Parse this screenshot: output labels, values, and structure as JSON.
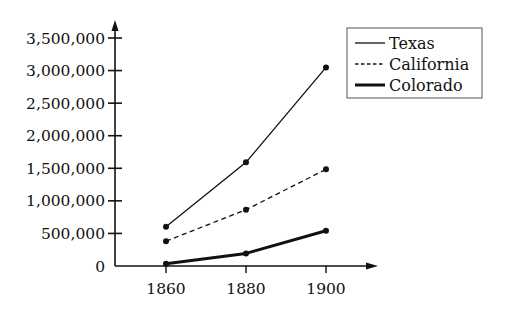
{
  "chart_data": {
    "type": "line",
    "title": "",
    "xlabel": "",
    "ylabel": "",
    "x": [
      1860,
      1880,
      1900
    ],
    "x_tick_labels": [
      "1860",
      "1880",
      "1900"
    ],
    "y_ticks": [
      0,
      500000,
      1000000,
      1500000,
      2000000,
      2500000,
      3000000,
      3500000
    ],
    "y_tick_labels": [
      "0",
      "500,000",
      "1,000,000",
      "1,500,000",
      "2,000,000",
      "2,500,000",
      "3,000,000",
      "3,500,000"
    ],
    "ylim": [
      0,
      3500000
    ],
    "grid": false,
    "legend_position": "upper right",
    "series": [
      {
        "name": "Texas",
        "style": "solid",
        "values": [
          604000,
          1592000,
          3049000
        ]
      },
      {
        "name": "California",
        "style": "dashed",
        "values": [
          380000,
          865000,
          1485000
        ]
      },
      {
        "name": "Colorado",
        "style": "thick",
        "values": [
          34000,
          194000,
          540000
        ]
      }
    ]
  }
}
